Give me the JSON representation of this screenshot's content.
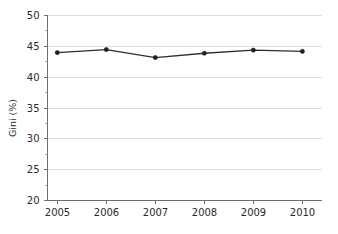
{
  "chart_data": {
    "type": "line",
    "title": "",
    "xlabel": "",
    "ylabel": "Gini (%)",
    "x": [
      2005,
      2006,
      2007,
      2008,
      2009,
      2010
    ],
    "categories": [
      "2005",
      "2006",
      "2007",
      "2008",
      "2009",
      "2010"
    ],
    "series": [
      {
        "name": "Gini",
        "values": [
          43.9,
          44.4,
          43.1,
          43.8,
          44.3,
          44.1
        ],
        "color": "#2f2f2f",
        "marker": "circle"
      }
    ],
    "ylim": [
      20,
      50
    ],
    "yticks": [
      20,
      25,
      30,
      35,
      40,
      45,
      50
    ],
    "ytick_labels": [
      "20",
      "25",
      "30",
      "35",
      "40",
      "45",
      "50"
    ],
    "y_minor_ticks": [
      22.5,
      27.5,
      32.5,
      37.5,
      42.5,
      47.5
    ],
    "xlim": [
      2004.8,
      2010.4
    ],
    "xticks": [
      2005,
      2006,
      2007,
      2008,
      2009,
      2010
    ],
    "xtick_labels": [
      "2005",
      "2006",
      "2007",
      "2008",
      "2009",
      "2010"
    ],
    "grid": "horizontal",
    "legend": "none",
    "background_color": "#ffffff",
    "gridline_color": "#d9d9d9",
    "axis_color": "#6e6e6e",
    "text_color": "#2b2b2b"
  }
}
